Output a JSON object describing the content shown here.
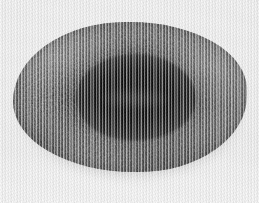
{
  "image": {
    "domain": "Natural-Image",
    "subject_label": "specimen",
    "description": "Grayscale photograph of a rounded rough-textured specimen with a dark central depression",
    "orientation": "landscape",
    "width_px": 259,
    "height_px": 203,
    "color_mode": "grayscale"
  },
  "background": {
    "name": "light-gray-backdrop",
    "base_color": "#e9e9e9",
    "top_color": "#ebebeb",
    "bottom_color": "#f0f0f0",
    "artifact": "vertical-scan-striping"
  },
  "specimen": {
    "name": "oval-specimen",
    "outline_color": "#4f4f4f",
    "rim_color": "#5d5d5d",
    "mid_tone_color": "#434343",
    "shadow_color": "#505050",
    "bounds": {
      "left_px": 13,
      "top_px": 22,
      "width_px": 234,
      "height_px": 150
    },
    "surface_texture": "rough-granular-with-concentric-ridges"
  },
  "depression": {
    "name": "central-dark-pit",
    "core_color": "#050505",
    "edge_color": "#242424",
    "bounds": {
      "left_px": 76,
      "top_px": 53,
      "width_px": 119,
      "height_px": 87
    },
    "inner_detail": "faint-lighter-smudge"
  },
  "texture_features": {
    "radiating_fibres": {
      "name": "radiating-fibrous-streaks",
      "location": "left-flank",
      "tone": "#3a3a3a"
    },
    "rim_rings": {
      "name": "concentric-rim-ridges",
      "tone": "#6a6a6a"
    }
  }
}
